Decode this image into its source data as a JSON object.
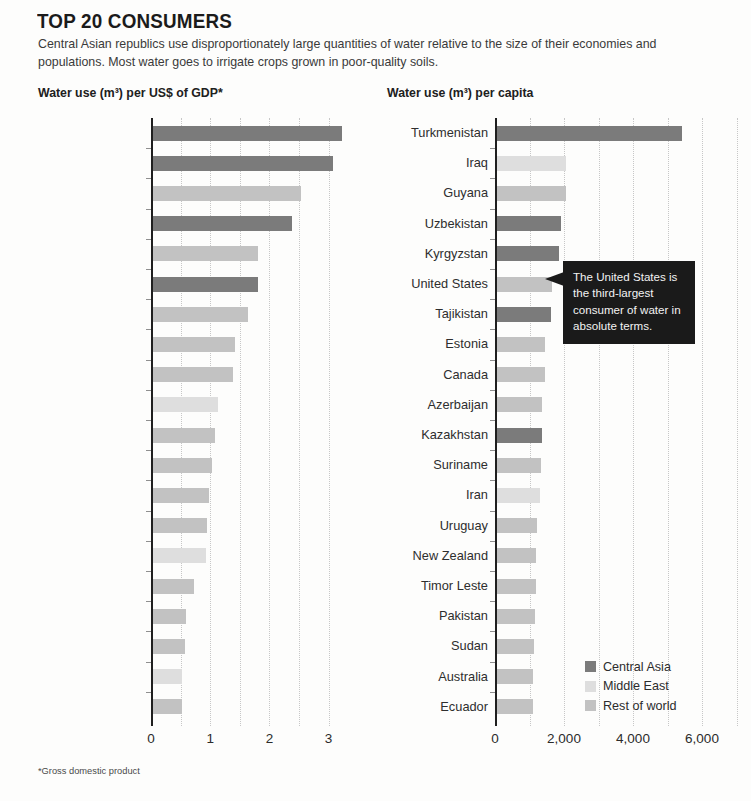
{
  "header": {
    "title": "TOP 20 CONSUMERS",
    "subtitle": "Central Asian republics use disproportionately large quantities of water relative to the size of their economies and populations. Most water goes to irrigate crops grown in poor-quality soils.",
    "footnote": "*Gross domestic product"
  },
  "legend": {
    "position": "bottom-right",
    "items": [
      {
        "label": "Central Asia",
        "color": "#7b7b7b"
      },
      {
        "label": "Middle East",
        "color": "#dedede"
      },
      {
        "label": "Rest of world",
        "color": "#c2c2c2"
      }
    ]
  },
  "callout": {
    "text": "The United States is the third-largest consumer of water in absolute terms.",
    "target": "United States",
    "background": "#1a1a1a",
    "text_color": "#f2f2f2"
  },
  "chart_data": [
    {
      "id": "gdp",
      "type": "bar",
      "orientation": "horizontal",
      "title": "Water use (m³) per US$ of GDP*",
      "xlabel": "",
      "ylabel": "",
      "xlim": [
        0,
        3.45
      ],
      "xticks": [
        "0",
        "1",
        "2",
        "3"
      ],
      "xtick_values": [
        0,
        1,
        2,
        3
      ],
      "grid": true,
      "grid_step": 0.5,
      "categories": [
        "Tajikistan",
        "Kyrgyzstan",
        "Madagascar",
        "Uzbekistan",
        "Afghanistan",
        "Turkmenistan",
        "Guyana",
        "Timor Leste",
        "Pakistan",
        "Sudan",
        "Vietnam",
        "Laos",
        "Nepal",
        "Mali",
        "Iraq",
        "Zimbabwe",
        "Philippines",
        "India",
        "Egypt",
        "Mauritania"
      ],
      "values": [
        3.2,
        3.05,
        2.5,
        2.35,
        1.78,
        1.78,
        1.62,
        1.4,
        1.36,
        1.1,
        1.05,
        1.0,
        0.95,
        0.92,
        0.9,
        0.7,
        0.57,
        0.55,
        0.5,
        0.5
      ],
      "groups": [
        "Central Asia",
        "Central Asia",
        "Rest of world",
        "Central Asia",
        "Rest of world",
        "Central Asia",
        "Rest of world",
        "Rest of world",
        "Rest of world",
        "Middle East",
        "Rest of world",
        "Rest of world",
        "Rest of world",
        "Rest of world",
        "Middle East",
        "Rest of world",
        "Rest of world",
        "Rest of world",
        "Middle East",
        "Rest of world"
      ]
    },
    {
      "id": "capita",
      "type": "bar",
      "orientation": "horizontal",
      "title": "Water use (m³) per capita",
      "xlabel": "",
      "ylabel": "",
      "xlim": [
        0,
        7250
      ],
      "xticks": [
        "0",
        "2,000",
        "4,000",
        "6,000"
      ],
      "xtick_values": [
        0,
        2000,
        4000,
        6000
      ],
      "grid": true,
      "grid_step": 1000,
      "categories": [
        "Turkmenistan",
        "Iraq",
        "Guyana",
        "Uzbekistan",
        "Kyrgyzstan",
        "United States",
        "Tajikistan",
        "Estonia",
        "Canada",
        "Azerbaijan",
        "Kazakhstan",
        "Suriname",
        "Iran",
        "Uruguay",
        "New Zealand",
        "Timor Leste",
        "Pakistan",
        "Sudan",
        "Australia",
        "Ecuador"
      ],
      "values": [
        5370,
        2000,
        2000,
        1870,
        1800,
        1600,
        1580,
        1400,
        1400,
        1330,
        1330,
        1300,
        1250,
        1180,
        1150,
        1130,
        1120,
        1080,
        1060,
        1050
      ],
      "groups": [
        "Central Asia",
        "Middle East",
        "Rest of world",
        "Central Asia",
        "Central Asia",
        "Rest of world",
        "Central Asia",
        "Rest of world",
        "Rest of world",
        "Rest of world",
        "Central Asia",
        "Rest of world",
        "Middle East",
        "Rest of world",
        "Rest of world",
        "Rest of world",
        "Rest of world",
        "Rest of world",
        "Rest of world",
        "Rest of world"
      ]
    }
  ],
  "layout": {
    "left": {
      "axis_x": 151,
      "px_per_unit": 59.2,
      "grid_max": 3.45,
      "label_right": 150
    },
    "right": {
      "axis_x": 495,
      "px_per_unit": 0.0345,
      "grid_max": 7250,
      "label_right": 494
    },
    "row_height": 30.2,
    "bar_height": 15,
    "plot_top": 6
  }
}
